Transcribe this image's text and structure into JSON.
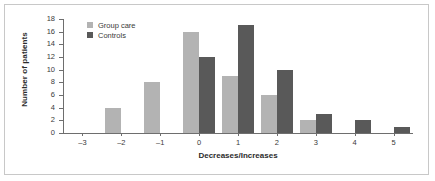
{
  "chart_data": {
    "type": "bar",
    "title": "",
    "xlabel": "Decreases/Increases",
    "ylabel": "Number of patients",
    "categories": [
      "-3",
      "-2",
      "-1",
      "0",
      "1",
      "2",
      "3",
      "4",
      "5"
    ],
    "series": [
      {
        "name": "Group care",
        "color": "#b3b3b3",
        "values": [
          0,
          4,
          8,
          16,
          9,
          6,
          2,
          0,
          0
        ]
      },
      {
        "name": "Controls",
        "color": "#595959",
        "values": [
          0,
          0,
          0,
          12,
          17,
          10,
          3,
          2,
          1
        ]
      }
    ],
    "ylim": [
      0,
      18
    ],
    "yticks": [
      0,
      2,
      4,
      6,
      8,
      10,
      12,
      14,
      16,
      18
    ],
    "grid": false,
    "legend_position": "top-left",
    "axis_color": "#6e6e6e",
    "background": "#ffffff",
    "border_color": "#c8c8c8"
  }
}
